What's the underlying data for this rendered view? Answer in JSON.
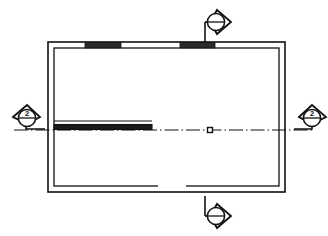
{
  "drawing": {
    "type": "architectural-floor-plan",
    "title": "",
    "background_color": "#ffffff",
    "line_color": "#111111",
    "fill_color": "#ffffff"
  },
  "building": {
    "name": "rectangular-building-outline",
    "outer": {
      "x": 48,
      "y": 42,
      "width": 237,
      "height": 150
    },
    "inner": {
      "x": 54,
      "y": 48,
      "width": 225,
      "height": 138
    },
    "wall_thickness": 6
  },
  "walls": {
    "top": {
      "label": "top-exterior-wall",
      "y": 42,
      "openings": [
        {
          "label": "window-top-left",
          "x": 85,
          "width": 36,
          "kind": "window"
        },
        {
          "label": "window-top-right",
          "x": 180,
          "width": 35,
          "kind": "window"
        }
      ]
    },
    "bottom": {
      "label": "bottom-exterior-wall",
      "y": 192,
      "openings": [
        {
          "label": "door-bottom-center",
          "x": 158,
          "width": 28,
          "kind": "door"
        }
      ]
    },
    "left": {
      "label": "left-exterior-wall",
      "x": 48
    },
    "right": {
      "label": "right-exterior-wall",
      "x": 285
    }
  },
  "partition": {
    "label": "interior-partition-wall",
    "x_start": 54,
    "x_end": 152,
    "y": 127,
    "thickness": 5
  },
  "centerline": {
    "label": "section-cut-centerline",
    "y": 130,
    "x_start": 14,
    "x_end": 312,
    "style": "dash-dot",
    "center_marker": {
      "label": "center-point-marker",
      "x": 210,
      "y": 130,
      "size": 5
    }
  },
  "section_markers": [
    {
      "id": "marker-top",
      "name": "section-marker-top",
      "position": "top",
      "cx": 217,
      "cy": 22,
      "radius": 9,
      "arrow_direction": "right",
      "label": "",
      "divider": "horizontal",
      "leader": {
        "from_x": 205,
        "from_y": 22,
        "elbow_x": 205,
        "to_y": 42
      }
    },
    {
      "id": "marker-left",
      "name": "section-marker-left",
      "position": "left",
      "cx": 26,
      "cy": 117,
      "radius": 9,
      "arrow_direction": "left",
      "label": "2",
      "divider": "horizontal",
      "leader": {
        "from_x": 26,
        "from_y": 129,
        "elbow_x": 45,
        "to_y": 129
      }
    },
    {
      "id": "marker-right",
      "name": "section-marker-right",
      "position": "right",
      "cx": 312,
      "cy": 117,
      "radius": 9,
      "arrow_direction": "right",
      "label": "2",
      "divider": "horizontal",
      "leader": {
        "from_x": 312,
        "from_y": 129,
        "elbow_x": 292,
        "to_y": 129
      }
    },
    {
      "id": "marker-bottom",
      "name": "section-marker-bottom",
      "position": "bottom",
      "cx": 217,
      "cy": 216,
      "radius": 9,
      "arrow_direction": "right",
      "label": "",
      "divider": "horizontal",
      "leader": {
        "from_x": 205,
        "from_y": 216,
        "elbow_x": 205,
        "to_y": 196
      }
    }
  ]
}
